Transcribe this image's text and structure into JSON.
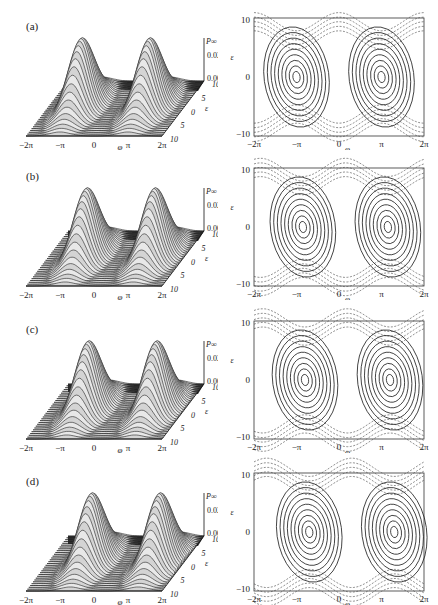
{
  "figure": {
    "panels": [
      {
        "label": "(a)",
        "top": 0
      },
      {
        "label": "(b)",
        "top": 150
      },
      {
        "label": "(c)",
        "top": 303
      },
      {
        "label": "(d)",
        "top": 455
      }
    ],
    "surface_axes": {
      "x_ticks": [
        "−2π",
        "−π",
        "0",
        "π",
        "2π"
      ],
      "x_label": "φ",
      "y_ticks": [
        "10",
        "5",
        "0",
        "5",
        "10"
      ],
      "y_label": "ε",
      "z_label": "P∞",
      "z_ticks": [
        "0.02",
        "0.00"
      ]
    },
    "contour_axes": {
      "x_ticks": [
        "−2π",
        "−π",
        "0",
        "π",
        "2π"
      ],
      "x_label": "φ",
      "y_ticks": [
        "10",
        "0",
        "−10"
      ],
      "y_label": "ε"
    }
  },
  "chart_data": [
    {
      "type": "surface",
      "panel": "(a)",
      "title": "",
      "xlabel": "φ",
      "ylabel": "ε",
      "zlabel": "P∞",
      "x_range": [
        "-2π",
        "2π"
      ],
      "y_range": [
        -10,
        10
      ],
      "z_ticks": [
        0.0,
        0.02
      ],
      "peaks": [
        {
          "phi": "-0.7π",
          "eps": 0
        },
        {
          "phi": "0.7π",
          "eps": 0
        }
      ]
    },
    {
      "type": "contour",
      "panel": "(a)",
      "xlabel": "φ",
      "ylabel": "ε",
      "x_ticks": [
        "-2π",
        "-π",
        "0",
        "π",
        "2π"
      ],
      "y_ticks": [
        -10,
        0,
        10
      ],
      "centers": [
        {
          "phi": "-π",
          "eps": 0
        },
        {
          "phi": "π",
          "eps": 0
        }
      ],
      "line_styles": {
        "closed_orbits": "solid",
        "open_orbits": "dashed"
      }
    },
    {
      "type": "surface",
      "panel": "(b)",
      "xlabel": "φ",
      "ylabel": "ε",
      "zlabel": "P∞",
      "x_range": [
        "-2π",
        "2π"
      ],
      "y_range": [
        -10,
        10
      ],
      "z_ticks": [
        0.0,
        0.02
      ]
    },
    {
      "type": "contour",
      "panel": "(b)",
      "xlabel": "φ",
      "ylabel": "ε",
      "x_ticks": [
        "-2π",
        "-π",
        "0",
        "π",
        "2π"
      ],
      "y_ticks": [
        -10,
        0,
        10
      ],
      "centers": [
        {
          "phi": "-0.85π",
          "eps": 0
        },
        {
          "phi": "1.15π",
          "eps": 0
        }
      ]
    },
    {
      "type": "surface",
      "panel": "(c)",
      "xlabel": "φ",
      "ylabel": "ε",
      "zlabel": "P∞",
      "x_range": [
        "-2π",
        "2π"
      ],
      "y_range": [
        -10,
        10
      ],
      "z_ticks": [
        0.0,
        0.02
      ]
    },
    {
      "type": "contour",
      "panel": "(c)",
      "xlabel": "φ",
      "ylabel": "ε",
      "x_ticks": [
        "-2π",
        "-π",
        "0",
        "π",
        "2π"
      ],
      "y_ticks": [
        -10,
        0,
        10
      ],
      "centers": [
        {
          "phi": "-0.8π",
          "eps": 0
        },
        {
          "phi": "1.2π",
          "eps": 0
        }
      ]
    },
    {
      "type": "surface",
      "panel": "(d)",
      "xlabel": "φ",
      "ylabel": "ε",
      "zlabel": "P∞",
      "x_range": [
        "-2π",
        "2π"
      ],
      "y_range": [
        -10,
        10
      ],
      "z_ticks": [
        0.0,
        0.02
      ]
    },
    {
      "type": "contour",
      "panel": "(d)",
      "xlabel": "φ",
      "ylabel": "ε",
      "x_ticks": [
        "-2π",
        "-π",
        "0",
        "π",
        "2π"
      ],
      "y_ticks": [
        -10,
        0,
        10
      ],
      "centers": [
        {
          "phi": "-0.7π",
          "eps": 0
        },
        {
          "phi": "1.3π",
          "eps": 0
        }
      ]
    }
  ]
}
